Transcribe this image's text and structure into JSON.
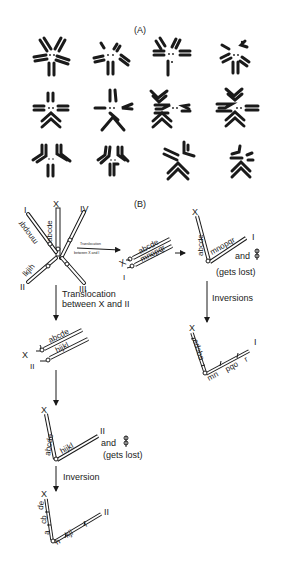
{
  "panel_a": {
    "label": "(A)",
    "rows": 3,
    "cols": 4,
    "description": "Twelve meiotic chromosome configurations drawn as radiating rod pairs around a central pair of dots"
  },
  "panel_b": {
    "label": "(B)",
    "initial": {
      "chromosomes": [
        {
          "name": "X",
          "genes": "abcde"
        },
        {
          "name": "I",
          "genes": "mnopqr"
        },
        {
          "name": "II",
          "genes": "lkjih"
        },
        {
          "name": "III",
          "genes": ""
        },
        {
          "name": "IV",
          "genes": ""
        }
      ]
    },
    "translocation_x_i": {
      "arrow_label_line1": "Translocation",
      "arrow_label_line2": "between X and I",
      "result": {
        "x_label": "X",
        "i_label": "I",
        "genes_top": "abcde",
        "genes_bottom": "mnopqr"
      }
    },
    "fused_x_i": {
      "x_label": "X",
      "i_label": "I",
      "genes_x": "abcde",
      "genes_i": "mnopqr",
      "and_text": "and",
      "lost_text": "(gets lost)"
    },
    "inversions": {
      "label": "Inversions",
      "x_label": "X",
      "i_label": "I",
      "genes_x": "edcba",
      "genes_i_1": "mn",
      "genes_i_2": "pqo",
      "genes_i_3": "r"
    },
    "translocation_x_ii": {
      "label_line1": "Translocation",
      "label_line2": "between X and II",
      "x_label": "X",
      "ii_label": "II",
      "genes_top": "abcde",
      "genes_bottom": "hijkl"
    },
    "fused_x_ii": {
      "x_label": "X",
      "ii_label": "II",
      "genes_x": "abcde",
      "genes_ii": "hijkl",
      "and_text": "and",
      "lost_text": "(gets lost)"
    },
    "inversion_final": {
      "label": "Inversion",
      "x_label": "X",
      "ii_label": "II",
      "genes_x_1": "de",
      "genes_x_2": "cb",
      "genes_x_3": "a",
      "genes_ii_1": "h",
      "genes_ii_2": "kji",
      "genes_ii_3": "l"
    }
  }
}
